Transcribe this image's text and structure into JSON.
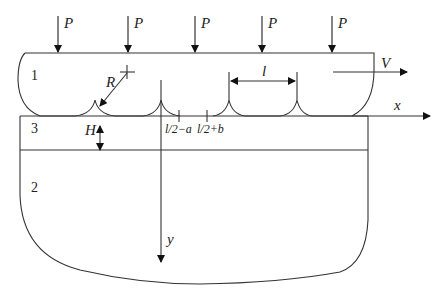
{
  "diagram": {
    "loads": [
      {
        "label": "P",
        "x": 58
      },
      {
        "label": "P",
        "x": 128
      },
      {
        "label": "P",
        "x": 195
      },
      {
        "label": "P",
        "x": 262
      },
      {
        "label": "P",
        "x": 332
      }
    ],
    "regions": {
      "region1": "1",
      "region2": "2",
      "region3": "3"
    },
    "labels": {
      "radius": "R",
      "thickness": "H",
      "spacing": "l",
      "velocity": "V",
      "x_axis": "x",
      "y_axis": "y",
      "tick_a": "l/2−a",
      "tick_b": "l/2+b"
    },
    "colors": {
      "line": "#333333",
      "background": "#ffffff"
    }
  }
}
